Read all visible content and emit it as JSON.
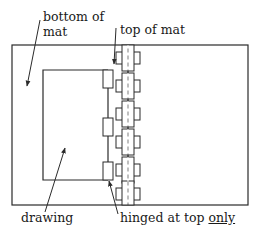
{
  "diagram": {
    "type": "mat hinging diagram",
    "labels": {
      "bottom_of_mat_line1": "bottom of",
      "bottom_of_mat_line2": "mat",
      "top_of_mat": "top of mat",
      "drawing": "drawing",
      "hinged_prefix": "hinged at top ",
      "hinged_emphasis": "only"
    },
    "colors": {
      "line": "#2a2a2a",
      "background": "#ffffff"
    },
    "hinge_count": 6,
    "drawing_tab_count": 3
  }
}
